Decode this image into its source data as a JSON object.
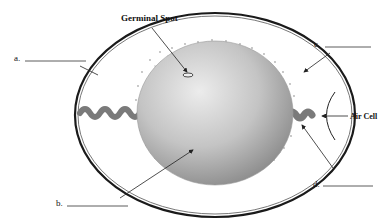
{
  "diagram": {
    "labels": {
      "germinal_spot": "Germinal Spot",
      "air_cell": "Air Cell",
      "a": "a.",
      "b": "b.",
      "c": "c.",
      "d": "d."
    },
    "blanks": {
      "a": "",
      "b": "",
      "c": "",
      "d": ""
    },
    "colors": {
      "shell": "#1a1a1a",
      "yolk_light": "#e6e6e6",
      "yolk_dark": "#8a8a8a",
      "chalaza": "#7a7a7a",
      "albumen_dots": "#b0b0b0",
      "background": "#ffffff"
    }
  }
}
